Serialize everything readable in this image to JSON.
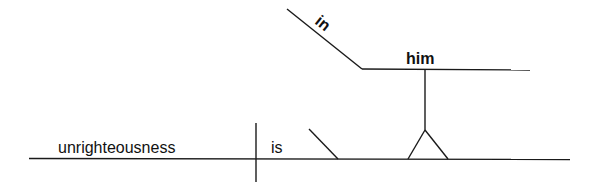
{
  "diagram": {
    "type": "sentence-diagram",
    "baseline": {
      "subject": "unrighteousness",
      "verb": "is"
    },
    "modifier_slant": {
      "label": ""
    },
    "prepositional_phrase": {
      "preposition": "in",
      "object": "him"
    },
    "colors": {
      "line": "#1a1a1a",
      "text": "#111111",
      "background": "#ffffff"
    }
  }
}
